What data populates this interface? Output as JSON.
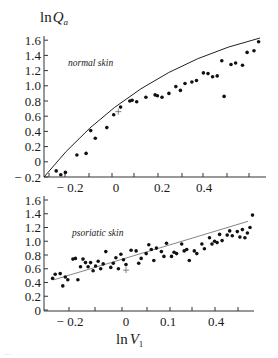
{
  "chart_data": [
    {
      "type": "scatter",
      "panel_label": "normal skin",
      "ylabel_main": "ln",
      "ylabel_var": "Q",
      "ylabel_sub": "a",
      "xlabel": "",
      "y_ticks": [
        "1.6",
        "1.4",
        "1.2",
        "1.0",
        "0.8",
        "0.6",
        "0.4",
        "0.2",
        "0",
        "− 0.2"
      ],
      "x_ticks": [
        "− 0.2",
        "0",
        "0.2",
        "0.4"
      ],
      "ylim": [
        -0.2,
        1.65
      ],
      "xlim": [
        -0.29,
        0.62
      ],
      "grid": false,
      "fit": "curve (concave, from (-0.28,-0.2) to (0.58,1.6))",
      "points": [
        [
          -0.26,
          -0.12
        ],
        [
          -0.24,
          -0.17
        ],
        [
          -0.22,
          -0.14
        ],
        [
          -0.17,
          0.09
        ],
        [
          -0.13,
          0.11
        ],
        [
          -0.11,
          0.41
        ],
        [
          -0.09,
          0.31
        ],
        [
          -0.04,
          0.45
        ],
        [
          -0.01,
          0.62
        ],
        [
          0.02,
          0.72
        ],
        [
          0.06,
          0.8
        ],
        [
          0.07,
          0.81
        ],
        [
          0.09,
          0.79
        ],
        [
          0.13,
          0.85
        ],
        [
          0.17,
          0.88
        ],
        [
          0.18,
          0.87
        ],
        [
          0.2,
          0.85
        ],
        [
          0.23,
          0.9
        ],
        [
          0.26,
          0.99
        ],
        [
          0.28,
          0.94
        ],
        [
          0.3,
          1.03
        ],
        [
          0.33,
          1.05
        ],
        [
          0.35,
          1.07
        ],
        [
          0.38,
          1.17
        ],
        [
          0.4,
          1.16
        ],
        [
          0.42,
          1.12
        ],
        [
          0.44,
          1.13
        ],
        [
          0.46,
          1.33
        ],
        [
          0.47,
          0.86
        ],
        [
          0.5,
          1.28
        ],
        [
          0.52,
          1.3
        ],
        [
          0.55,
          1.27
        ],
        [
          0.57,
          1.44
        ],
        [
          0.6,
          1.46
        ],
        [
          0.62,
          1.58
        ]
      ],
      "marker_plus": [
        0.01,
        0.66
      ]
    },
    {
      "type": "scatter",
      "panel_label": "psoriatic skin",
      "xlabel_main": "ln",
      "xlabel_var": "V",
      "xlabel_sub": "1",
      "y_ticks": [
        "1.6",
        "1.4",
        "1.2",
        "1.0",
        "0.8",
        "0.6",
        "0.4",
        "0.2",
        "0"
      ],
      "x_ticks": [
        "− 0.2",
        "0",
        "0.1",
        "0.4"
      ],
      "ylim": [
        0,
        1.6
      ],
      "grid": false,
      "fit": "linear, from ~0.45 at left to ~1.3 at right",
      "points": [
        [
          -0.29,
          0.46
        ],
        [
          -0.28,
          0.52
        ],
        [
          -0.26,
          0.53
        ],
        [
          -0.25,
          0.35
        ],
        [
          -0.24,
          0.48
        ],
        [
          -0.23,
          0.44
        ],
        [
          -0.21,
          0.74
        ],
        [
          -0.2,
          0.75
        ],
        [
          -0.19,
          0.44
        ],
        [
          -0.18,
          0.63
        ],
        [
          -0.17,
          0.74
        ],
        [
          -0.16,
          0.69
        ],
        [
          -0.15,
          0.63
        ],
        [
          -0.14,
          0.69
        ],
        [
          -0.13,
          0.57
        ],
        [
          -0.12,
          0.64
        ],
        [
          -0.11,
          0.71
        ],
        [
          -0.1,
          0.6
        ],
        [
          -0.09,
          0.67
        ],
        [
          -0.08,
          0.85
        ],
        [
          -0.06,
          0.62
        ],
        [
          -0.05,
          0.68
        ],
        [
          -0.04,
          0.76
        ],
        [
          -0.03,
          0.6
        ],
        [
          -0.02,
          0.81
        ],
        [
          -0.01,
          0.73
        ],
        [
          0.0,
          0.66
        ],
        [
          0.02,
          0.87
        ],
        [
          0.04,
          0.86
        ],
        [
          0.05,
          0.68
        ],
        [
          0.06,
          0.75
        ],
        [
          0.08,
          0.82
        ],
        [
          0.09,
          0.95
        ],
        [
          0.1,
          0.88
        ],
        [
          0.11,
          0.72
        ],
        [
          0.12,
          0.9
        ],
        [
          0.14,
          0.85
        ],
        [
          0.15,
          0.78
        ],
        [
          0.16,
          0.97
        ],
        [
          0.18,
          0.78
        ],
        [
          0.19,
          0.84
        ],
        [
          0.2,
          0.82
        ],
        [
          0.22,
          0.96
        ],
        [
          0.23,
          0.86
        ],
        [
          0.24,
          0.88
        ],
        [
          0.25,
          0.72
        ],
        [
          0.27,
          0.86
        ],
        [
          0.28,
          0.82
        ],
        [
          0.3,
          0.96
        ],
        [
          0.31,
          0.89
        ],
        [
          0.33,
          1.05
        ],
        [
          0.34,
          0.96
        ],
        [
          0.35,
          1.0
        ],
        [
          0.36,
          0.98
        ],
        [
          0.37,
          1.1
        ],
        [
          0.38,
          1.01
        ],
        [
          0.4,
          1.09
        ],
        [
          0.41,
          1.15
        ],
        [
          0.42,
          1.08
        ],
        [
          0.44,
          1.14
        ],
        [
          0.45,
          1.06
        ],
        [
          0.46,
          1.17
        ],
        [
          0.47,
          1.05
        ],
        [
          0.48,
          1.12
        ],
        [
          0.49,
          1.2
        ],
        [
          0.5,
          1.38
        ]
      ],
      "marker_plus": [
        0.0,
        0.58
      ]
    }
  ],
  "caption": "…"
}
